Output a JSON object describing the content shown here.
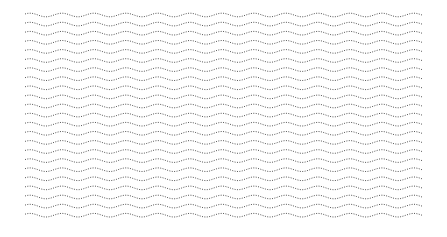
{
  "pattern": {
    "name": "dotted wavy lines",
    "row_count": 23,
    "color": "#555555",
    "background": "#ffffff"
  }
}
